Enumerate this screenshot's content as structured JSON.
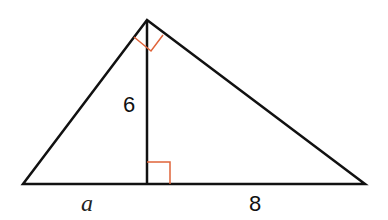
{
  "diagram": {
    "type": "right-triangle-with-altitude",
    "vertices": {
      "left": [
        23,
        184
      ],
      "apex": [
        147,
        20
      ],
      "right": [
        365,
        184
      ],
      "altitude_foot": [
        147,
        184
      ]
    },
    "labels": {
      "altitude": "6",
      "left_segment": "a",
      "right_segment": "8"
    },
    "right_angle_markers": [
      "apex",
      "altitude_foot"
    ],
    "colors": {
      "lines": "#111111",
      "markers": "#e0643a"
    }
  }
}
